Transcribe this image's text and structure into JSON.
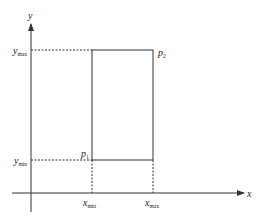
{
  "diagram": {
    "axes": {
      "x_label": "x",
      "y_label": "y"
    },
    "rectangle": {
      "corner_min_label": "p",
      "corner_min_sub": "1",
      "corner_max_label": "p",
      "corner_max_sub": "2"
    },
    "ticks": {
      "x_min": {
        "base": "x",
        "sub": "min"
      },
      "x_max": {
        "base": "x",
        "sub": "max"
      },
      "y_min": {
        "base": "y",
        "sub": "min"
      },
      "y_max": {
        "base": "y",
        "sub": "max"
      }
    },
    "colors": {
      "line": "#333333",
      "background": "#ffffff"
    }
  }
}
